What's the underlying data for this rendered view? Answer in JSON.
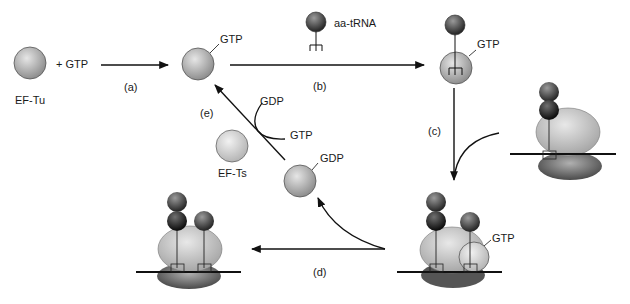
{
  "diagram": {
    "colors": {
      "ef_tu": "#a9a9a9",
      "ef_ts": "#c8c8c8",
      "trna_dark": "#3a3a3a",
      "trna_mid": "#6b6b6b",
      "ribosome_large": "#bdbdbd",
      "ribosome_small": "#707070",
      "ribosome_small_dark": "#4f4f4f",
      "line": "#111111"
    },
    "labels": {
      "ef_tu": "EF-Tu",
      "plus_gtp": "+ GTP",
      "step_a": "(a)",
      "gtp_1": "GTP",
      "aa_trna": "aa-tRNA",
      "step_b": "(b)",
      "gtp_2": "GTP",
      "step_c": "(c)",
      "gtp_3": "GTP",
      "step_d": "(d)",
      "gdp_1": "GDP",
      "ef_ts": "EF-Ts",
      "step_e": "(e)",
      "gdp_2": "GDP",
      "gtp_4": "GTP"
    }
  }
}
